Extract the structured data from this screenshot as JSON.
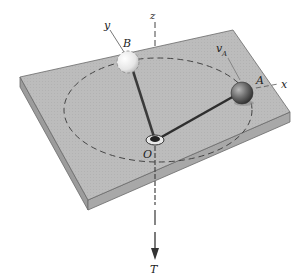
{
  "diagram": {
    "labels": {
      "z_axis": "z",
      "y_axis": "y",
      "x_axis": "x",
      "ball_b": "B",
      "ball_a": "A",
      "velocity_a_main": "v",
      "velocity_a_sub": "A",
      "origin": "O",
      "tension": "T"
    },
    "colors": {
      "plate_top": "#b9b9b9",
      "plate_side": "#a3a3a3",
      "plate_edge": "#6a6a6a",
      "ball_a": "#6e6e6e",
      "ball_b": "#e8e8e8",
      "rod": "#3a3a3a",
      "dashed": "#444444"
    }
  }
}
